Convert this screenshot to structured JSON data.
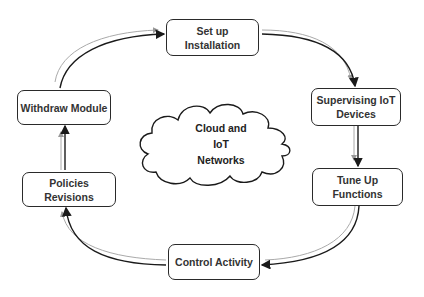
{
  "diagram": {
    "type": "cycle",
    "center": {
      "label": "Cloud and\nIoT\nNetworks",
      "shape": "cloud"
    },
    "nodes": [
      {
        "id": "setup",
        "label": "Set up\nInstallation"
      },
      {
        "id": "supervising",
        "label": "Supervising IoT\nDevices"
      },
      {
        "id": "tuneup",
        "label": "Tune Up\nFunctions"
      },
      {
        "id": "control",
        "label": "Control Activity"
      },
      {
        "id": "policies",
        "label": "Policies Revisions"
      },
      {
        "id": "withdraw",
        "label": "Withdraw Module"
      }
    ],
    "edges": [
      {
        "from": "setup",
        "to": "supervising"
      },
      {
        "from": "supervising",
        "to": "tuneup"
      },
      {
        "from": "tuneup",
        "to": "control"
      },
      {
        "from": "control",
        "to": "policies"
      },
      {
        "from": "policies",
        "to": "withdraw"
      },
      {
        "from": "withdraw",
        "to": "setup"
      }
    ],
    "colors": {
      "stroke": "#2a2a2a",
      "shadow_stroke": "#aaaaaa",
      "text": "#333333",
      "background": "#ffffff"
    }
  }
}
